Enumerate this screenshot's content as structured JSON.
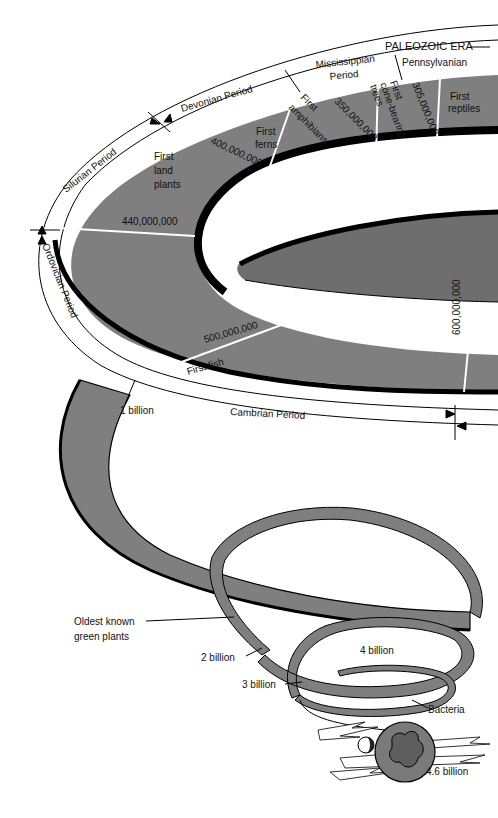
{
  "diagram": {
    "colors": {
      "band": "#7f7f7f",
      "band_dark": "#6e6e6e",
      "edge": "#000000",
      "background": "#ffffff",
      "white_band": "#ffffff",
      "divider": "#ffffff"
    },
    "era": {
      "label": "PALEOZOIC ERA"
    },
    "periods": [
      {
        "label": "Pennsylvanian"
      },
      {
        "label": "Mississippian",
        "label2": "Period"
      },
      {
        "label": "Devonian Period"
      },
      {
        "label": "Silurian Period"
      },
      {
        "label": "Ordovician Period"
      },
      {
        "label": "Cambrian Period"
      }
    ],
    "dates": {
      "d305": "305,000,000",
      "d350": "350,000,000",
      "d400": "400,000,000",
      "d440": "440,000,000",
      "d500": "500,000,000",
      "d600": "600,000,000",
      "b1": "1 billion",
      "b2": "2 billion",
      "b3": "3 billion",
      "b4": "4 billion",
      "b46": "4.6 billion"
    },
    "events": {
      "reptiles": [
        "First",
        "reptiles"
      ],
      "cone": [
        "First",
        "cone-bearing",
        "trees"
      ],
      "amphibians": [
        "First",
        "amphibians"
      ],
      "ferns": [
        "First",
        "ferns"
      ],
      "land_plants": [
        "First",
        "land",
        "plants"
      ],
      "fish": "First fish",
      "green_plants": [
        "Oldest known",
        "green plants"
      ],
      "bacteria": "Bacteria"
    }
  }
}
